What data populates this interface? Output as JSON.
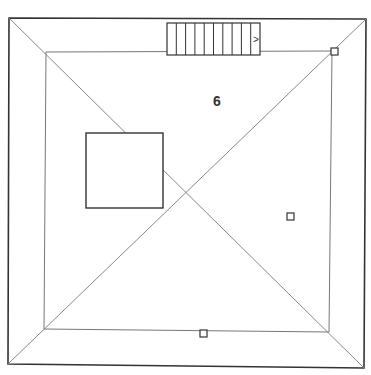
{
  "diagram": {
    "type": "roof-plan",
    "room_label": "6",
    "colors": {
      "outer": "#333333",
      "inner": "#777777",
      "lines": "#888888",
      "fixtures": "#333333"
    },
    "outer": {
      "tl": [
        9,
        18
      ],
      "tr": [
        366,
        19
      ],
      "br": [
        364,
        368
      ],
      "bl": [
        8,
        364
      ]
    },
    "inner": {
      "tl": [
        46,
        52
      ],
      "tr": [
        332,
        51
      ],
      "br": [
        329,
        332
      ],
      "bl": [
        44,
        329
      ]
    },
    "stairs": {
      "x": 167,
      "y": 23,
      "width": 93,
      "height": 32,
      "treads": 10,
      "arrow": ">"
    },
    "block": {
      "x": 86,
      "y": 133,
      "width": 77,
      "height": 75
    },
    "markers": [
      {
        "x": 331,
        "y": 48
      },
      {
        "x": 287,
        "y": 213
      },
      {
        "x": 200,
        "y": 330
      }
    ]
  }
}
